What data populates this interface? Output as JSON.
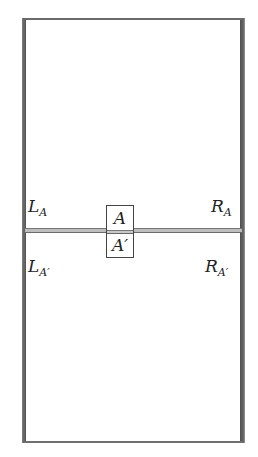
{
  "diagram": {
    "frame": {
      "stroke_color": "#555555"
    },
    "center_box": {
      "top_label": "A",
      "bottom_label": "A′"
    },
    "labels": {
      "left_top": {
        "main": "L",
        "sub": "A"
      },
      "right_top": {
        "main": "R",
        "sub": "A"
      },
      "left_bottom": {
        "main": "L",
        "sub": "A′"
      },
      "right_bottom": {
        "main": "R",
        "sub": "A′"
      }
    }
  }
}
